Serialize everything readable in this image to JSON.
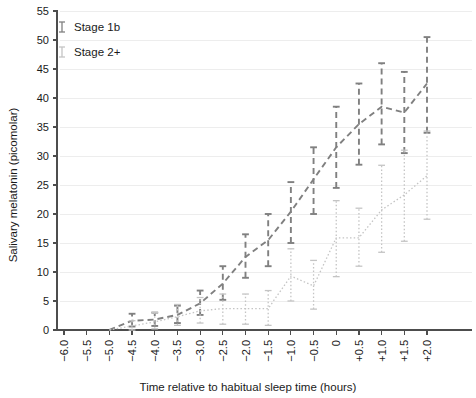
{
  "chart_data": {
    "type": "line",
    "title": "",
    "xlabel": "Time relative to habitual sleep time (hours)",
    "ylabel": "Salivary melatonin (picomolar)",
    "x": [
      -6.0,
      -5.5,
      -5.0,
      -4.5,
      -4.0,
      -3.5,
      -3.0,
      -2.5,
      -2.0,
      -1.5,
      -1.0,
      -0.5,
      0,
      0.5,
      1.0,
      1.5,
      2.0
    ],
    "xticklabels": [
      "−6.0",
      "−5.5",
      "−5.0",
      "−4.5",
      "−4.0",
      "−3.5",
      "−3.0",
      "−2.5",
      "−2.0",
      "−1.5",
      "−1.0",
      "−0.5",
      "0",
      "+0.5",
      "+1.0",
      "+1.5",
      "+2.0"
    ],
    "yticks": [
      0,
      5,
      10,
      15,
      20,
      25,
      30,
      35,
      40,
      45,
      50,
      55
    ],
    "ylim": [
      0,
      55
    ],
    "grid": true,
    "legend_position": "top-left",
    "series": [
      {
        "name": "Stage 1b",
        "color": "#808080",
        "linestyle": "dashed",
        "x_start_index": 2,
        "values": [
          null,
          null,
          0.0,
          1.6,
          1.8,
          2.6,
          4.6,
          8.0,
          12.6,
          15.5,
          20.4,
          26.0,
          31.5,
          35.5,
          38.5,
          37.5,
          42.5
        ],
        "err_low": [
          null,
          null,
          0.0,
          0.6,
          0.7,
          1.2,
          2.6,
          5.2,
          9.0,
          11.0,
          15.0,
          20.0,
          24.5,
          28.5,
          32.0,
          30.5,
          34.0
        ],
        "err_high": [
          null,
          null,
          0.0,
          2.8,
          3.0,
          4.2,
          6.8,
          11.0,
          16.5,
          20.0,
          25.5,
          31.5,
          38.5,
          42.5,
          46.0,
          44.5,
          50.5
        ]
      },
      {
        "name": "Stage 2+",
        "color": "#c4c4c4",
        "linestyle": "dotted",
        "x_start_index": 2,
        "values": [
          null,
          null,
          0.0,
          0.7,
          1.4,
          2.3,
          3.3,
          3.7,
          3.7,
          3.7,
          9.3,
          7.6,
          15.9,
          15.9,
          20.7,
          23.3,
          26.6
        ],
        "err_low": [
          null,
          null,
          0.0,
          0.0,
          0.2,
          0.8,
          1.2,
          1.0,
          1.0,
          0.8,
          5.0,
          3.6,
          9.2,
          11.0,
          13.4,
          15.3,
          19.1
        ],
        "err_high": [
          null,
          null,
          0.0,
          1.6,
          3.0,
          4.4,
          5.6,
          6.2,
          6.2,
          6.8,
          14.0,
          12.0,
          22.3,
          21.0,
          28.4,
          31.0,
          34.3
        ]
      }
    ]
  },
  "legend": {
    "items": [
      {
        "label": "Stage 1b",
        "color": "#808080"
      },
      {
        "label": "Stage 2+",
        "color": "#c4c4c4"
      }
    ]
  }
}
